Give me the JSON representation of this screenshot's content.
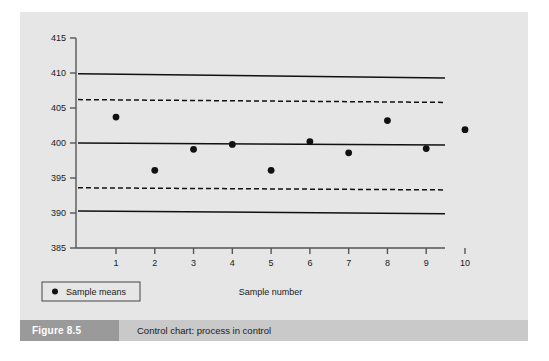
{
  "figure": {
    "number_label": "Figure 8.5",
    "caption": "Control chart: process in control",
    "number_box_color": "#9a9a9a",
    "caption_bar_color": "#c9c9c9",
    "panel_color": "#e6e6e6"
  },
  "chart_data": {
    "type": "scatter",
    "title": "",
    "xlabel": "Sample number",
    "ylabel": "",
    "x": [
      1,
      2,
      3,
      4,
      5,
      6,
      7,
      8,
      9,
      10
    ],
    "categories": [
      "1",
      "2",
      "3",
      "4",
      "5",
      "6",
      "7",
      "8",
      "9",
      "10"
    ],
    "series": [
      {
        "name": "Sample means",
        "values": [
          403.7,
          396.1,
          399.1,
          399.8,
          396.1,
          400.2,
          398.6,
          403.2,
          399.2,
          401.9
        ],
        "marker": "filled-circle",
        "color": "#111111"
      }
    ],
    "xlim": [
      0,
      10.6
    ],
    "ylim": [
      385,
      415
    ],
    "yticks": [
      385,
      390,
      395,
      400,
      405,
      410,
      415
    ],
    "ytick_labels": [
      "385",
      "390",
      "395",
      "400",
      "405",
      "410",
      "415"
    ],
    "xticks": [
      1,
      2,
      3,
      4,
      5,
      6,
      7,
      8,
      9,
      10
    ],
    "xtick_labels": [
      "1",
      "2",
      "3",
      "4",
      "5",
      "6",
      "7",
      "8",
      "9",
      "10"
    ],
    "grid": false,
    "legend": {
      "position": "bottom-left",
      "entries": [
        "Sample means"
      ]
    },
    "reference_lines": [
      {
        "name": "upper-control-limit",
        "style": "solid",
        "color": "#111111",
        "y_left": 409.9,
        "y_right": 409.3
      },
      {
        "name": "upper-warning-limit",
        "style": "dashed",
        "color": "#111111",
        "y_left": 406.2,
        "y_right": 405.8
      },
      {
        "name": "centre-line",
        "style": "solid",
        "color": "#111111",
        "y_left": 400.0,
        "y_right": 399.7
      },
      {
        "name": "lower-warning-limit",
        "style": "dashed",
        "color": "#111111",
        "y_left": 393.6,
        "y_right": 393.3
      },
      {
        "name": "lower-control-limit",
        "style": "solid",
        "color": "#111111",
        "y_left": 390.3,
        "y_right": 389.9
      }
    ]
  }
}
